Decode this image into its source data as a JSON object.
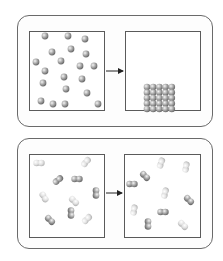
{
  "diagram": {
    "title": "",
    "panels": [
      {
        "id": "panel-1",
        "description": "Gas particles condensing into a packed solid",
        "before": {
          "label": "",
          "state": "scattered single particles",
          "particle_count": 24,
          "particles": [
            [
              45,
              36
            ],
            [
              68,
              36
            ],
            [
              85,
              39
            ],
            [
              52,
              52
            ],
            [
              71,
              49
            ],
            [
              86,
              54
            ],
            [
              36,
              62
            ],
            [
              61,
              61
            ],
            [
              80,
              66
            ],
            [
              94,
              66
            ],
            [
              45,
              71
            ],
            [
              64,
              77
            ],
            [
              82,
              79
            ],
            [
              43,
              83
            ],
            [
              66,
              89
            ],
            [
              87,
              93
            ],
            [
              41,
              101
            ],
            [
              53,
              104
            ],
            [
              65,
              104
            ],
            [
              98,
              104
            ]
          ]
        },
        "arrow": "→",
        "after": {
          "label": "",
          "state": "ordered close-packed block",
          "grid_rows": 5,
          "grid_cols": 5
        }
      },
      {
        "id": "panel-2",
        "description": "Diatomic molecules moving randomly before and after",
        "before": {
          "label": "",
          "molecule_count": 10,
          "molecules": [
            {
              "x": 39,
              "y": 163,
              "angle": 0,
              "shade": "light"
            },
            {
              "x": 86,
              "y": 162,
              "angle": -50,
              "shade": "light"
            },
            {
              "x": 58,
              "y": 180,
              "angle": -40,
              "shade": "dark"
            },
            {
              "x": 77,
              "y": 179,
              "angle": 0,
              "shade": "dark"
            },
            {
              "x": 96,
              "y": 193,
              "angle": 90,
              "shade": "dark"
            },
            {
              "x": 44,
              "y": 197,
              "angle": 60,
              "shade": "light"
            },
            {
              "x": 74,
              "y": 201,
              "angle": 45,
              "shade": "light"
            },
            {
              "x": 71,
              "y": 213,
              "angle": 90,
              "shade": "dark"
            },
            {
              "x": 50,
              "y": 220,
              "angle": 45,
              "shade": "dark"
            },
            {
              "x": 87,
              "y": 219,
              "angle": -45,
              "shade": "light"
            }
          ]
        },
        "arrow": "→",
        "after": {
          "label": "",
          "molecule_count": 10,
          "molecules": [
            {
              "x": 161,
              "y": 163,
              "angle": -70,
              "shade": "light"
            },
            {
              "x": 186,
              "y": 167,
              "angle": -80,
              "shade": "light"
            },
            {
              "x": 145,
              "y": 176,
              "angle": 45,
              "shade": "dark"
            },
            {
              "x": 132,
              "y": 184,
              "angle": 0,
              "shade": "dark"
            },
            {
              "x": 165,
              "y": 193,
              "angle": -75,
              "shade": "light"
            },
            {
              "x": 189,
              "y": 200,
              "angle": 45,
              "shade": "dark"
            },
            {
              "x": 134,
              "y": 210,
              "angle": -80,
              "shade": "light"
            },
            {
              "x": 163,
              "y": 212,
              "angle": 0,
              "shade": "dark"
            },
            {
              "x": 148,
              "y": 224,
              "angle": 90,
              "shade": "dark"
            },
            {
              "x": 183,
              "y": 225,
              "angle": 45,
              "shade": "light"
            }
          ]
        }
      }
    ],
    "colors": {
      "frame_border": "#6a6a6a",
      "box_border": "#5a5a5a",
      "arrow": "#222222",
      "particle_dark": "#8a8a8a",
      "particle_light": "#d8d8d8"
    }
  }
}
